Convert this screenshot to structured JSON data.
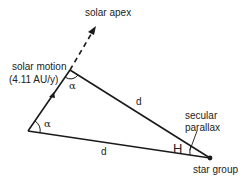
{
  "diagram": {
    "labels": {
      "solar_apex": "solar apex",
      "solar_motion": "solar motion",
      "solar_motion_value": "(4.11 AU/y)",
      "alpha_top": "α",
      "alpha_bottom": "α",
      "d_upper": "d",
      "d_lower": "d",
      "H": "H",
      "secular_parallax_1": "secular",
      "secular_parallax_2": "parallax",
      "star_group": "star group"
    },
    "colors": {
      "line": "#1a1a1a",
      "text": "#222222"
    }
  }
}
